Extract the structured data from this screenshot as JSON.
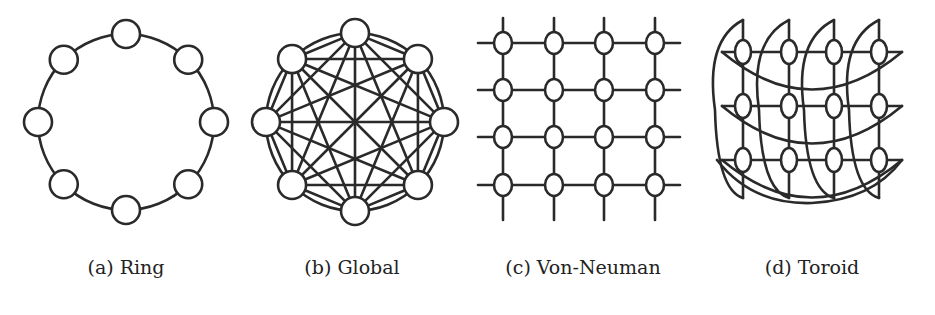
{
  "figure": {
    "panels": [
      {
        "id": "ring",
        "caption": "(a) Ring",
        "topology": "ring",
        "node_count": 8
      },
      {
        "id": "global",
        "caption": "(b) Global",
        "topology": "fully-connected",
        "node_count": 8
      },
      {
        "id": "von-neuman",
        "caption": "(c) Von-Neuman",
        "topology": "grid",
        "rows": 4,
        "cols": 4
      },
      {
        "id": "toroid",
        "caption": "(d) Toroid",
        "topology": "torus",
        "rows": 3,
        "cols": 4
      }
    ],
    "colors": {
      "stroke": "#2a2a2a",
      "background": "#ffffff"
    }
  }
}
